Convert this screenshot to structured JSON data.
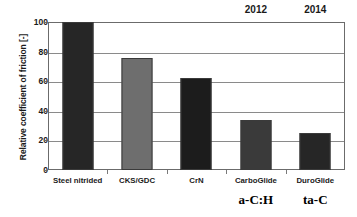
{
  "chart_data": {
    "type": "bar",
    "title": "",
    "xlabel": "",
    "ylabel": "Relative coefficient of friction [-]",
    "ylim": [
      0,
      100
    ],
    "yticks": [
      0,
      20,
      40,
      60,
      80,
      100
    ],
    "grid": true,
    "legend": "none",
    "categories": [
      "Steel nitrided",
      "CKS/GDC",
      "CrN",
      "CarboGlide",
      "DuroGlide"
    ],
    "values": [
      100,
      76,
      62,
      34,
      25
    ],
    "bar_colors": [
      "#262626",
      "#6e6e6e",
      "#1c1c1c",
      "#3a3a3a",
      "#262626"
    ],
    "annotations": [
      {
        "text": "2012",
        "category": "CarboGlide",
        "position": "top"
      },
      {
        "text": "2014",
        "category": "DuroGlide",
        "position": "top"
      },
      {
        "text": "a-C:H",
        "category": "CarboGlide",
        "position": "below-axis"
      },
      {
        "text": "ta-C",
        "category": "DuroGlide",
        "position": "below-axis"
      }
    ]
  },
  "axis": {
    "y_title": "Relative coefficient of friction [-]",
    "y_tick_labels": [
      "100",
      "80",
      "60",
      "40",
      "20",
      "0"
    ]
  },
  "bars": [
    {
      "label": "Steel nitrided",
      "value": 100,
      "color": "#262626"
    },
    {
      "label": "CKS/GDC",
      "value": 76,
      "color": "#6e6e6e"
    },
    {
      "label": "CrN",
      "value": 62,
      "color": "#1c1c1c"
    },
    {
      "label": "CarboGlide",
      "value": 34,
      "color": "#3a3a3a"
    },
    {
      "label": "DuroGlide",
      "value": 25,
      "color": "#262626"
    }
  ],
  "years": [
    {
      "text": "2012"
    },
    {
      "text": "2014"
    }
  ],
  "groups": [
    {
      "text": "a-C:H"
    },
    {
      "text": "ta-C"
    }
  ]
}
